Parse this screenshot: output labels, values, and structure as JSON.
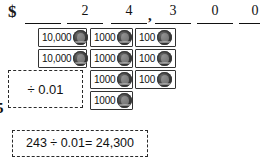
{
  "worksheet": {
    "currency_symbol": "$",
    "thousands_separator": ",",
    "place_value_slots": [
      {
        "digit": ""
      },
      {
        "digit": "2"
      },
      {
        "digit": "4"
      },
      {
        "digit": "3"
      },
      {
        "digit": "0"
      },
      {
        "digit": "0"
      }
    ],
    "edge_glyph": "5",
    "columns": [
      {
        "place": "ten-thousands",
        "denomination_label": "10,000",
        "count": 2,
        "notes": [
          {
            "amount": "10,000",
            "coin": "coin-icon"
          },
          {
            "amount": "10,000",
            "coin": "coin-icon"
          }
        ]
      },
      {
        "place": "thousands",
        "denomination_label": "1000",
        "count": 4,
        "notes": [
          {
            "amount": "1000",
            "coin": "coin-icon"
          },
          {
            "amount": "1000",
            "coin": "coin-icon"
          },
          {
            "amount": "1000",
            "coin": "coin-icon"
          },
          {
            "amount": "1000",
            "coin": "coin-icon"
          }
        ]
      },
      {
        "place": "hundreds",
        "denomination_label": "100",
        "count": 3,
        "notes": [
          {
            "amount": "100",
            "coin": "coin-icon"
          },
          {
            "amount": "100",
            "coin": "coin-icon"
          },
          {
            "amount": "100",
            "coin": "coin-icon"
          }
        ]
      }
    ],
    "divisor_callout": "÷ 0.01",
    "equation_callout": "243 ÷ 0.01= 24,300"
  },
  "colors": {
    "ink": "#111111",
    "rule": "#111111",
    "note_border": "#333333",
    "dash_border": "#2a2a2a",
    "coin_dark": "#2b2b2b",
    "background": "#ffffff"
  }
}
